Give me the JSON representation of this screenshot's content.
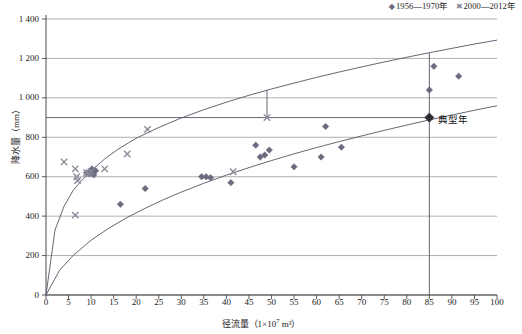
{
  "chart_data": {
    "type": "scatter",
    "title": "",
    "xlabel": "径流量（1×10⁷ m³）",
    "ylabel": "降水量（mm）",
    "xlim": [
      0,
      100
    ],
    "ylim": [
      0,
      1400
    ],
    "xticks": [
      0,
      5,
      10,
      15,
      20,
      25,
      30,
      35,
      40,
      45,
      50,
      55,
      60,
      65,
      70,
      75,
      80,
      85,
      90,
      95,
      100
    ],
    "yticks": [
      0,
      200,
      400,
      600,
      800,
      1000,
      1200,
      1400
    ],
    "grid": "horizontal",
    "legend_position": "top-right",
    "series": [
      {
        "name": "1956—1970年",
        "marker": "diamond",
        "color": "#6b6b80",
        "points": [
          [
            9.0,
            620
          ],
          [
            9.5,
            615
          ],
          [
            10.0,
            625
          ],
          [
            10.2,
            640
          ],
          [
            10.6,
            610
          ],
          [
            11.0,
            630
          ],
          [
            16.5,
            460
          ],
          [
            22.0,
            540
          ],
          [
            34.5,
            600
          ],
          [
            35.5,
            600
          ],
          [
            36.5,
            595
          ],
          [
            41.0,
            570
          ],
          [
            46.5,
            760
          ],
          [
            47.5,
            700
          ],
          [
            48.5,
            710
          ],
          [
            49.5,
            735
          ],
          [
            55.0,
            650
          ],
          [
            61.0,
            700
          ],
          [
            62.0,
            855
          ],
          [
            65.5,
            750
          ],
          [
            85.0,
            1040
          ],
          [
            86.0,
            1160
          ],
          [
            91.5,
            1110
          ]
        ]
      },
      {
        "name": "2000—2012年",
        "marker": "cross",
        "color": "#8a8a9a",
        "points": [
          [
            4.0,
            675
          ],
          [
            6.5,
            640
          ],
          [
            6.8,
            600
          ],
          [
            7.0,
            580
          ],
          [
            9.0,
            620
          ],
          [
            9.5,
            615
          ],
          [
            10.0,
            625
          ],
          [
            6.5,
            405
          ],
          [
            13.0,
            640
          ],
          [
            18.0,
            715
          ],
          [
            22.5,
            840
          ],
          [
            41.5,
            625
          ],
          [
            49.0,
            900
          ]
        ]
      }
    ],
    "curves": [
      {
        "name": "upper-envelope-curve",
        "color": "#555566",
        "points": [
          [
            0,
            0
          ],
          [
            2,
            330
          ],
          [
            4,
            450
          ],
          [
            6,
            530
          ],
          [
            8,
            585
          ],
          [
            10,
            630
          ],
          [
            13,
            690
          ],
          [
            16,
            740
          ],
          [
            20,
            795
          ],
          [
            25,
            850
          ],
          [
            30,
            898
          ],
          [
            35,
            940
          ],
          [
            40,
            978
          ],
          [
            45,
            1013
          ],
          [
            50,
            1045
          ],
          [
            55,
            1075
          ],
          [
            60,
            1104
          ],
          [
            65,
            1131
          ],
          [
            70,
            1157
          ],
          [
            75,
            1182
          ],
          [
            80,
            1206
          ],
          [
            85,
            1229
          ],
          [
            90,
            1251
          ],
          [
            95,
            1273
          ],
          [
            100,
            1293
          ]
        ]
      },
      {
        "name": "lower-envelope-curve",
        "color": "#555566",
        "points": [
          [
            0,
            0
          ],
          [
            3,
            125
          ],
          [
            6,
            200
          ],
          [
            10,
            278
          ],
          [
            14,
            340
          ],
          [
            18,
            393
          ],
          [
            22,
            440
          ],
          [
            26,
            483
          ],
          [
            30,
            522
          ],
          [
            35,
            567
          ],
          [
            40,
            608
          ],
          [
            45,
            646
          ],
          [
            50,
            682
          ],
          [
            55,
            716
          ],
          [
            60,
            748
          ],
          [
            65,
            778
          ],
          [
            70,
            807
          ],
          [
            75,
            835
          ],
          [
            80,
            862
          ],
          [
            85,
            888
          ],
          [
            90,
            913
          ],
          [
            95,
            937
          ],
          [
            100,
            960
          ]
        ]
      }
    ],
    "annotations": [
      {
        "name": "typical-year",
        "label": "典型年",
        "marker": "diamond",
        "x": 85,
        "y": 900,
        "guide_line": {
          "x": 85,
          "y_from": 1229,
          "y_to": 0
        }
      },
      {
        "name": "sample-drop-line",
        "label": "",
        "x": 49,
        "y_from": 1038,
        "y_to": 900
      }
    ]
  },
  "legend": {
    "entries": [
      {
        "marker": "diamond",
        "label": "1956—1970年"
      },
      {
        "marker": "cross",
        "label": "2000—2012年"
      }
    ]
  },
  "axes": {
    "y_title": "降水量（mm）",
    "x_title_main": "径流量（1×10",
    "x_title_sup": "7",
    "x_title_tail": " m³）",
    "y_tick_labels": [
      "0",
      "200",
      "400",
      "600",
      "800",
      "1 000",
      "1 200",
      "1 400"
    ],
    "x_tick_labels": [
      "0",
      "5",
      "10",
      "15",
      "20",
      "25",
      "30",
      "35",
      "40",
      "45",
      "50",
      "55",
      "60",
      "65",
      "70",
      "75",
      "80",
      "85",
      "90",
      "95",
      "100"
    ]
  },
  "annotations": {
    "typical_year_label": "典型年"
  },
  "colors": {
    "series1": "#6b6b80",
    "series2": "#8a8a9a",
    "curve": "#555566",
    "grid": "#9a9a9a",
    "axis": "#4a4a4a",
    "text": "#1a1a1a"
  }
}
